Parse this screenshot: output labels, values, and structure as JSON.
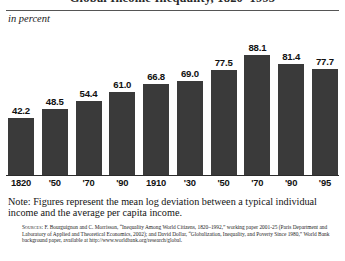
{
  "figure": {
    "title": "Global Income Inequality, 1820–1995",
    "subtitle": "in percent",
    "note": "Note: Figures represent the mean log deviation between a typical individual income and the average per capita income.",
    "sources_lead": "Sources:",
    "sources_body": " F. Bourguignon and C. Morrisson, “Inequality Among World Citizens, 1820–1992,” working paper 2001-25 (Paris Department and Laboratory of Applied and Theoretical Economics, 2002); and David Dollar, “Globalization, Inequality, and Poverty Since 1980,” World Bank background paper, available at http://www.worldbank.org/research/global."
  },
  "chart_data": {
    "type": "bar",
    "title": "Global Income Inequality, 1820–1995",
    "subtitle": "in percent",
    "xlabel": "",
    "ylabel": "in percent",
    "ylim": [
      0,
      100
    ],
    "grid": false,
    "legend": null,
    "categories": [
      "1820",
      "'50",
      "'70",
      "'90",
      "1910",
      "'30",
      "'50",
      "'70",
      "'90",
      "'95"
    ],
    "values": [
      42.2,
      48.5,
      54.4,
      61.0,
      66.8,
      69.0,
      77.5,
      88.1,
      81.4,
      77.7
    ],
    "value_labels": [
      "42.2",
      "48.5",
      "54.4",
      "61.0",
      "66.8",
      "69.0",
      "77.5",
      "88.1",
      "81.4",
      "77.7"
    ],
    "bar_color": "#3a3a3a",
    "annotations": [
      "Note: Figures represent the mean log deviation between a typical individual income and the average per capita income."
    ]
  }
}
